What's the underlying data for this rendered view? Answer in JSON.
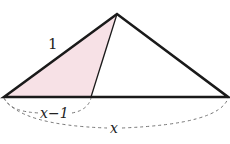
{
  "diagram": {
    "type": "triangle-geometry",
    "vertices": {
      "apex": [
        117,
        14
      ],
      "left": [
        4,
        97
      ],
      "right": [
        228,
        97
      ],
      "base_point": [
        91,
        97
      ]
    },
    "shaded_region_color": "#f7e1e6",
    "stroke_color": "#1a1a1a",
    "dashed_color": "#777777",
    "labels": {
      "side_left": "1",
      "segment_short": "x−1",
      "segment_full": "x"
    }
  }
}
